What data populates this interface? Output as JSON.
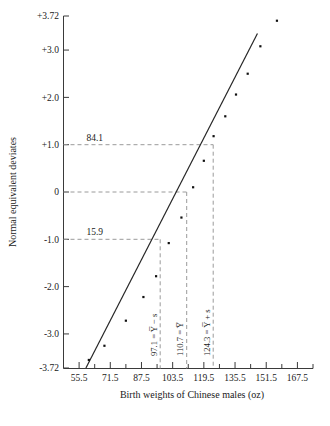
{
  "chart_data": {
    "type": "scatter",
    "title": "",
    "xlabel": "Birth weights of Chinese males (oz)",
    "ylabel": "Normal equivalent deviates",
    "xlim": [
      47.5,
      175.5
    ],
    "ylim": [
      -3.72,
      3.72
    ],
    "grid": false,
    "legend": null,
    "x_ticks": [
      "55.5",
      "71.5",
      "87.5",
      "103.5",
      "119.5",
      "135.5",
      "151.5",
      "167.5"
    ],
    "x_tick_values": [
      55.5,
      71.5,
      87.5,
      103.5,
      119.5,
      135.5,
      151.5,
      167.5
    ],
    "x_minor_tick_values": [
      47.5,
      63.5,
      79.5,
      95.5,
      111.5,
      127.5,
      143.5,
      159.5,
      175.5
    ],
    "y_ticks": [
      "+3.72",
      "+3.0",
      "+2.0",
      "+1.0",
      "0",
      "-1.0",
      "-2.0",
      "-3.0",
      "-3.72"
    ],
    "y_tick_values": [
      3.72,
      3.0,
      2.0,
      1.0,
      0,
      -1.0,
      -2.0,
      -3.0,
      -3.72
    ],
    "points": [
      {
        "x": 60.5,
        "y": -3.55
      },
      {
        "x": 68.5,
        "y": -3.25
      },
      {
        "x": 79.5,
        "y": -2.72
      },
      {
        "x": 88.5,
        "y": -2.22
      },
      {
        "x": 95.0,
        "y": -1.78
      },
      {
        "x": 101.5,
        "y": -1.08
      },
      {
        "x": 108.0,
        "y": -0.54
      },
      {
        "x": 114.0,
        "y": 0.1
      },
      {
        "x": 119.5,
        "y": 0.66
      },
      {
        "x": 124.5,
        "y": 1.18
      },
      {
        "x": 130.5,
        "y": 1.6
      },
      {
        "x": 136.0,
        "y": 2.06
      },
      {
        "x": 142.0,
        "y": 2.5
      },
      {
        "x": 148.5,
        "y": 3.08
      },
      {
        "x": 157.0,
        "y": 3.62
      }
    ],
    "fit_line": {
      "x1": 59.0,
      "y1": -3.72,
      "x2": 147.0,
      "y2": 3.35
    },
    "annotations": [
      {
        "name": "percentile-upper",
        "label": "84.1",
        "y_value": 1.0,
        "x_value": 124.3
      },
      {
        "name": "percentile-median",
        "label": "",
        "y_value": 0.0,
        "x_value": 110.7
      },
      {
        "name": "percentile-lower",
        "label": "15.9",
        "y_value": -1.0,
        "x_value": 97.1
      }
    ],
    "vertical_markers": [
      {
        "name": "mean-minus-s",
        "text": "97.1 = Y̅ − s",
        "x_value": 97.1,
        "value": 97.1
      },
      {
        "name": "mean",
        "text": "110.7 = Y̅",
        "x_value": 110.7,
        "value": 110.7
      },
      {
        "name": "mean-plus-s",
        "text": "124.3 = Y̅ + s",
        "x_value": 124.3,
        "value": 124.3
      }
    ]
  },
  "figure": {
    "caption_fragment": ""
  }
}
